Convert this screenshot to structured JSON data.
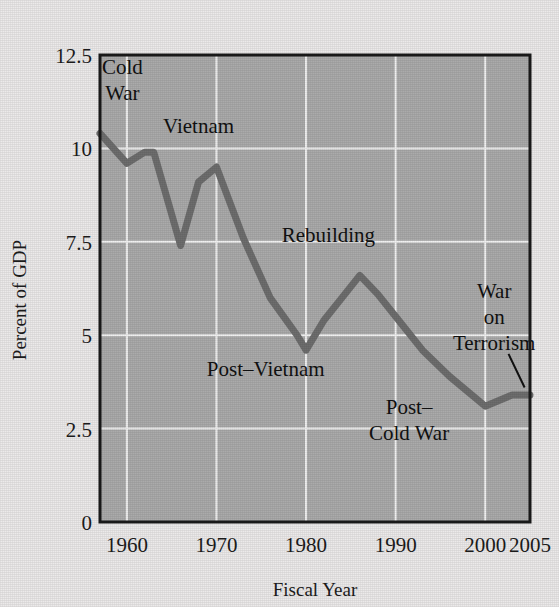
{
  "chart_data": {
    "type": "line",
    "title": "",
    "xlabel": "Fiscal Year",
    "ylabel": "Percent of GDP",
    "xlim": [
      1957,
      2005
    ],
    "ylim": [
      0,
      12.5
    ],
    "grid": true,
    "legend": "none",
    "xticks": [
      "1960",
      "1970",
      "1980",
      "1990",
      "2000",
      "2005"
    ],
    "xtick_values": [
      1960,
      1970,
      1980,
      1990,
      2000,
      2005
    ],
    "yticks": [
      "0",
      "2.5",
      "5",
      "7.5",
      "10",
      "12.5"
    ],
    "ytick_values": [
      0,
      2.5,
      5,
      7.5,
      10,
      12.5
    ],
    "series": [
      {
        "name": "Defense spending",
        "color": "#6e6e6e",
        "x": [
          1957,
          1960,
          1962,
          1963,
          1966,
          1968,
          1970,
          1973,
          1976,
          1979,
          1980,
          1982,
          1984,
          1986,
          1988,
          1990,
          1993,
          1996,
          2000,
          2001,
          2003,
          2005
        ],
        "values": [
          10.4,
          9.6,
          9.9,
          9.9,
          7.4,
          9.1,
          9.5,
          7.6,
          6.0,
          5.0,
          4.6,
          5.4,
          6.0,
          6.6,
          6.1,
          5.5,
          4.6,
          3.9,
          3.1,
          3.2,
          3.4,
          3.4
        ]
      }
    ],
    "annotations": [
      {
        "id": "cold-war",
        "lines": [
          "Cold",
          "War"
        ],
        "x_year": 1959.5,
        "y_value": 12.0
      },
      {
        "id": "vietnam",
        "lines": [
          "Vietnam"
        ],
        "x_year": 1968.0,
        "y_value": 10.4
      },
      {
        "id": "rebuilding",
        "lines": [
          "Rebuilding"
        ],
        "x_year": 1982.5,
        "y_value": 7.5
      },
      {
        "id": "post-vietnam",
        "lines": [
          "Post–Vietnam"
        ],
        "x_year": 1975.5,
        "y_value": 3.9
      },
      {
        "id": "post-cold-war",
        "lines": [
          "Post–",
          "Cold War"
        ],
        "x_year": 1991.5,
        "y_value": 2.9
      },
      {
        "id": "war-on-terrorism",
        "lines": [
          "War",
          "on",
          "Terrorism"
        ],
        "x_year": 2001.0,
        "y_value": 6.0
      }
    ],
    "pointer": {
      "id": "terrorism-pointer",
      "from": [
        2002.6,
        4.5
      ],
      "to": [
        2004.4,
        3.6
      ]
    },
    "colors": {
      "plot_background": "#ababab",
      "page_background": "#eceaea",
      "gridline": "#f2f2f2",
      "line": "#6e6e6e",
      "frame": "#1a1a1a",
      "text": "#111111"
    }
  }
}
